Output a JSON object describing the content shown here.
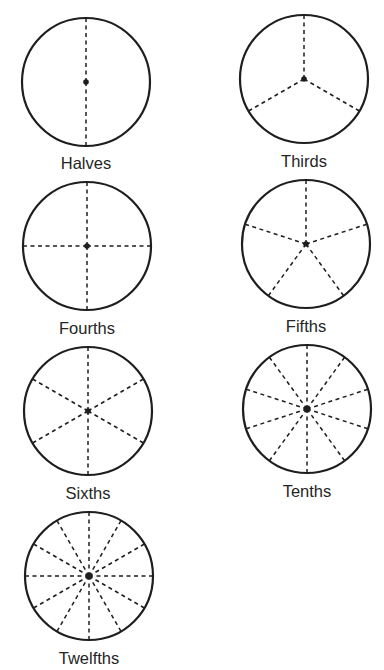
{
  "diagram": {
    "stroke_color": "#1e1e1e",
    "circle_stroke_width": 2.2,
    "divider_stroke_width": 1.5,
    "divider_dash": "4 3.5",
    "radius": 64,
    "circles": [
      {
        "id": "halves",
        "label": "Halves",
        "parts": 2,
        "cx": 86,
        "cy": 82,
        "label_y": 153,
        "start_angle_deg": -90
      },
      {
        "id": "thirds",
        "label": "Thirds",
        "parts": 3,
        "cx": 304,
        "cy": 79,
        "label_y": 151,
        "start_angle_deg": -90
      },
      {
        "id": "fourths",
        "label": "Fourths",
        "parts": 4,
        "cx": 87,
        "cy": 246,
        "label_y": 318,
        "start_angle_deg": -90
      },
      {
        "id": "fifths",
        "label": "Fifths",
        "parts": 5,
        "cx": 306,
        "cy": 244,
        "label_y": 316,
        "start_angle_deg": -90
      },
      {
        "id": "sixths",
        "label": "Sixths",
        "parts": 6,
        "cx": 88,
        "cy": 411,
        "label_y": 483,
        "start_angle_deg": -90
      },
      {
        "id": "tenths",
        "label": "Tenths",
        "parts": 10,
        "cx": 307,
        "cy": 409,
        "label_y": 481,
        "start_angle_deg": -90
      },
      {
        "id": "twelfths",
        "label": "Twelfths",
        "parts": 12,
        "cx": 89,
        "cy": 576,
        "label_y": 648,
        "start_angle_deg": -90
      }
    ]
  },
  "labels": {
    "halves": "Halves",
    "thirds": "Thirds",
    "fourths": "Fourths",
    "fifths": "Fifths",
    "sixths": "Sixths",
    "tenths": "Tenths",
    "twelfths": "Twelfths"
  }
}
